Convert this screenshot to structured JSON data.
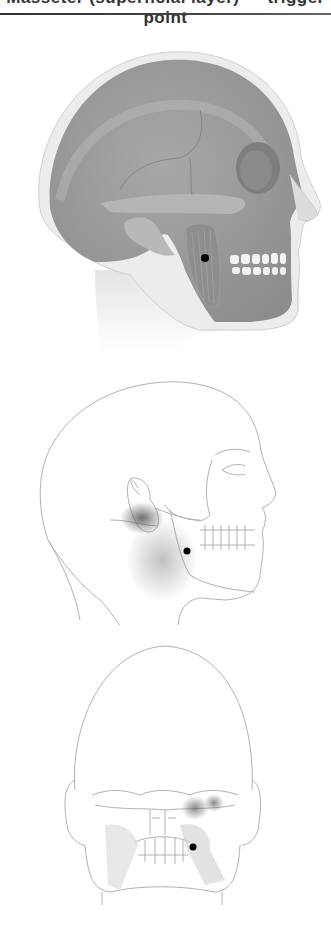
{
  "header": {
    "caption_fragment": "Masseter (superficial layer) — trigger point",
    "rule_color": "#333333"
  },
  "figures": [
    {
      "id": "lateral-anatomy",
      "view": "lateral skull with masseter muscle",
      "trigger_point": {
        "x": 205,
        "y": 258
      }
    },
    {
      "id": "lateral-referral",
      "view": "lateral line drawing with pain referral pattern",
      "trigger_point": {
        "x": 187,
        "y": 551
      }
    },
    {
      "id": "posterior-referral",
      "view": "posterior line drawing with pain referral pattern",
      "trigger_point": {
        "x": 193,
        "y": 847
      }
    }
  ],
  "colors": {
    "skin": "#ececec",
    "bone": "#9a9a9a",
    "bone_dark": "#7a7a7a",
    "line": "#9a9a9a",
    "referral": "#555555",
    "trigger_dot": "#000000"
  }
}
